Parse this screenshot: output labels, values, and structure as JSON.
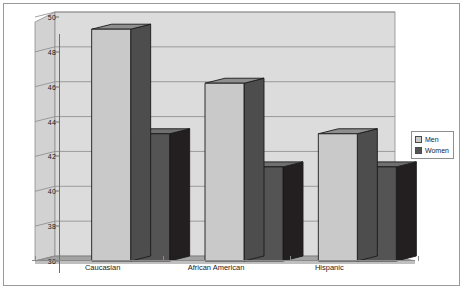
{
  "chart_data": {
    "type": "bar",
    "title": "",
    "subtitle": "",
    "xlabel": "",
    "ylabel": "",
    "categories": [
      "Caucasian",
      "African American",
      "Hispanic"
    ],
    "series": [
      {
        "name": "Men",
        "values": [
          49.3,
          46.2,
          43.3
        ],
        "color": "#c9c9c9"
      },
      {
        "name": "Women",
        "values": [
          43.3,
          41.4,
          41.4
        ],
        "color": "#545454"
      }
    ],
    "ylim": [
      36,
      50
    ],
    "yticks": [
      36,
      38,
      40,
      42,
      44,
      46,
      48,
      50
    ],
    "ytick_labels": [
      "36",
      "38",
      "40",
      "42",
      "44",
      "46",
      "48",
      "50"
    ],
    "grid": true,
    "grid_axis": "y",
    "legend_position": "right",
    "three_d": true,
    "style": {
      "plot_wall": "#dcdcdc",
      "floor": "#a3a3a3",
      "gridline": "#8a8a8a",
      "frame_border": "#9a9a9a",
      "background": "#ffffff",
      "men_front": "#c9c9c9",
      "men_top": "#8e8e8e",
      "men_side": "#4d4d4d",
      "women_front": "#545454",
      "women_top": "#6f6f6f",
      "women_side": "#231f20",
      "bar_outline": "#1a1a1a"
    }
  },
  "legend": {
    "items": [
      {
        "label": "Men",
        "swatch": "#c9c9c9"
      },
      {
        "label": "Women",
        "swatch": "#545454"
      }
    ]
  }
}
